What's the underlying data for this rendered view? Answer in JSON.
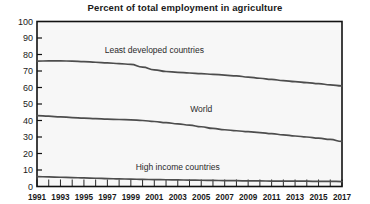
{
  "chart_data": {
    "type": "line",
    "title": "Percent of total employment in agriculture",
    "xlabel": "",
    "ylabel": "",
    "ylim": [
      0,
      100
    ],
    "xlim": [
      1991,
      2017
    ],
    "grid": false,
    "legend_position": "inline-annotations",
    "yticks": [
      0,
      10,
      20,
      30,
      40,
      50,
      60,
      70,
      80,
      90,
      100
    ],
    "ytick_labels": [
      "0",
      "10",
      "20",
      "30",
      "40",
      "50",
      "60",
      "70",
      "80",
      "90",
      "100"
    ],
    "xticks": [
      1991,
      1992,
      1993,
      1994,
      1995,
      1996,
      1997,
      1998,
      1999,
      2000,
      2001,
      2002,
      2003,
      2004,
      2005,
      2006,
      2007,
      2008,
      2009,
      2010,
      2011,
      2012,
      2013,
      2014,
      2015,
      2016,
      2017
    ],
    "xtick_labels": [
      "1991",
      "1993",
      "1995",
      "1997",
      "1999",
      "2001",
      "2003",
      "2005",
      "2007",
      "2009",
      "2011",
      "2013",
      "2015",
      "2017"
    ],
    "xtick_label_years": [
      1991,
      1993,
      1995,
      1997,
      1999,
      2001,
      2003,
      2005,
      2007,
      2009,
      2011,
      2013,
      2015,
      2017
    ],
    "x": [
      1991,
      1992,
      1993,
      1994,
      1995,
      1996,
      1997,
      1998,
      1999,
      2000,
      2001,
      2002,
      2003,
      2004,
      2005,
      2006,
      2007,
      2008,
      2009,
      2010,
      2011,
      2012,
      2013,
      2014,
      2015,
      2016,
      2017
    ],
    "series": [
      {
        "name": "Least developed countries",
        "label_x": 2001,
        "label_y": 81,
        "values": [
          76.0,
          76.1,
          76.1,
          76.0,
          75.7,
          75.3,
          74.9,
          74.5,
          74.0,
          72.3,
          70.7,
          69.7,
          69.2,
          68.8,
          68.4,
          68.0,
          67.5,
          67.0,
          66.3,
          65.6,
          64.9,
          64.2,
          63.6,
          63.0,
          62.3,
          61.6,
          61.0
        ]
      },
      {
        "name": "World",
        "label_x": 2005,
        "label_y": 45,
        "values": [
          43.0,
          42.6,
          42.2,
          41.8,
          41.4,
          41.1,
          40.8,
          40.6,
          40.4,
          40.0,
          39.4,
          38.7,
          38.0,
          37.2,
          36.2,
          35.2,
          34.4,
          33.8,
          33.2,
          32.7,
          32.0,
          31.3,
          30.6,
          30.0,
          29.3,
          28.5,
          27.3
        ]
      },
      {
        "name": "High income countries",
        "label_x": 2003,
        "label_y": 10,
        "values": [
          6.0,
          5.8,
          5.6,
          5.4,
          5.2,
          5.0,
          4.8,
          4.6,
          4.5,
          4.3,
          4.2,
          4.1,
          4.0,
          3.9,
          3.8,
          3.7,
          3.6,
          3.5,
          3.4,
          3.4,
          3.3,
          3.3,
          3.2,
          3.2,
          3.1,
          3.1,
          3.0
        ]
      }
    ]
  },
  "colors": {
    "line": "#4d4d4d",
    "frame": "#111111",
    "plot_background": "#f7f7f7",
    "page_background": "#ffffff",
    "text": "#1a1a1a"
  }
}
